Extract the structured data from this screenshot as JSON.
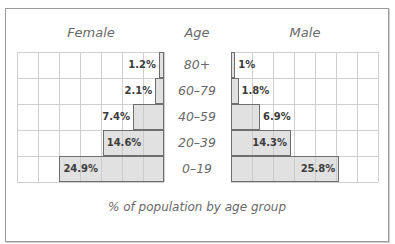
{
  "chart_data": {
    "type": "bar",
    "subtype": "population-pyramid",
    "title": "",
    "caption": "% of population by age group",
    "center_label": "Age",
    "categories": [
      "80+",
      "60–79",
      "40–59",
      "20–39",
      "0–19"
    ],
    "series": [
      {
        "name": "Female",
        "values": [
          1.2,
          2.1,
          7.4,
          14.6,
          24.9
        ],
        "labels": [
          "1.2%",
          "2.1%",
          "7.4%",
          "14.6%",
          "24.9%"
        ],
        "direction": "left"
      },
      {
        "name": "Male",
        "values": [
          1.0,
          1.8,
          6.9,
          14.3,
          25.8
        ],
        "labels": [
          "1%",
          "1.8%",
          "6.9%",
          "14.3%",
          "25.8%"
        ],
        "direction": "right"
      }
    ],
    "xlim": [
      0,
      35
    ],
    "grid_step": 5,
    "grid": true,
    "legend": "none",
    "colors": {
      "bar_fill": "#e2e2e2",
      "bar_border": "#6e6e6e",
      "grid": "#cfcfcf",
      "text": "#6a6a6a"
    }
  }
}
